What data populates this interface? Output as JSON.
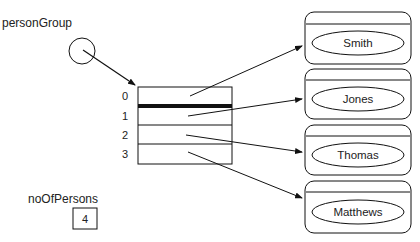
{
  "diagram": {
    "reference": {
      "label": "personGroup"
    },
    "array": {
      "indices": [
        "0",
        "1",
        "2",
        "3"
      ]
    },
    "counter": {
      "label": "noOfPersons",
      "value": "4"
    },
    "objects": [
      {
        "name": "Smith"
      },
      {
        "name": "Jones"
      },
      {
        "name": "Thomas"
      },
      {
        "name": "Matthews"
      }
    ]
  }
}
